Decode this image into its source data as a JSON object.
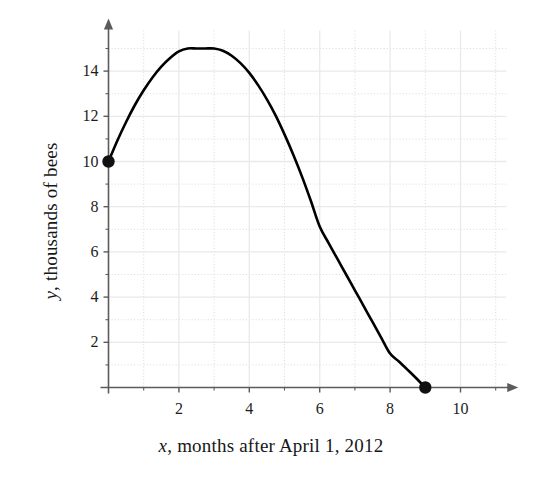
{
  "chart_data": {
    "type": "line",
    "title": "",
    "subtitle": "",
    "xlabel": "x, months after April 1, 2012",
    "ylabel": "y, thousands of bees",
    "xlabel_var": "x",
    "xlabel_rest": ", months after April 1, 2012",
    "ylabel_var": "y",
    "ylabel_rest": ", thousands of bees",
    "xlim": [
      0,
      11.3
    ],
    "ylim": [
      0,
      15.8
    ],
    "grid": true,
    "grid_style": "major solid light, minor dotted",
    "legend": "none",
    "x_ticks": [
      2,
      4,
      6,
      8,
      10
    ],
    "x_tick_labels": [
      "2",
      "4",
      "6",
      "8",
      "10"
    ],
    "x_minor_ticks": [
      1,
      3,
      5,
      7,
      9,
      11
    ],
    "y_ticks": [
      2,
      4,
      6,
      8,
      10,
      12,
      14
    ],
    "y_tick_labels": [
      "2",
      "4",
      "6",
      "8",
      "10",
      "12",
      "14"
    ],
    "y_minor_ticks": [
      1,
      3,
      5,
      7,
      9,
      11,
      13,
      15
    ],
    "series": [
      {
        "name": "bee population",
        "color": "#000000",
        "x": [
          0.0,
          0.25,
          0.5,
          0.75,
          1.0,
          1.25,
          1.5,
          1.75,
          2.0,
          2.25,
          2.5,
          2.75,
          3.0,
          3.25,
          3.5,
          3.75,
          4.0,
          4.25,
          4.5,
          4.75,
          5.0,
          5.25,
          5.5,
          5.75,
          6.0,
          6.25,
          6.5,
          6.75,
          7.0,
          7.25,
          7.5,
          7.75,
          8.0,
          8.25,
          8.5,
          8.75,
          9.0
        ],
        "y": [
          10.0,
          10.92,
          11.75,
          12.5,
          13.15,
          13.72,
          14.2,
          14.58,
          14.87,
          15.0,
          15.0,
          15.0,
          15.0,
          14.9,
          14.68,
          14.35,
          13.92,
          13.38,
          12.75,
          12.03,
          11.2,
          10.3,
          9.32,
          8.25,
          7.12,
          6.4,
          5.7,
          5.0,
          4.3,
          3.6,
          2.9,
          2.2,
          1.5,
          1.15,
          0.78,
          0.4,
          0.0
        ]
      }
    ],
    "markers": [
      {
        "label": "start-point",
        "x": 0,
        "y": 10,
        "style": "filled-circle"
      },
      {
        "label": "end-point",
        "x": 9,
        "y": 0,
        "style": "filled-circle"
      }
    ],
    "annotations": []
  },
  "colors": {
    "curve": "#111111",
    "axis": "#5b5b5b",
    "grid_major": "#e9e9ec",
    "grid_minor": "#d9d9de",
    "text": "#1a1a1a",
    "background": "#ffffff"
  }
}
